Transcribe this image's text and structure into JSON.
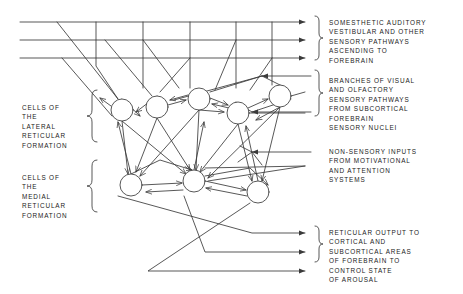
{
  "figure": {
    "stroke_color": "#3a3a3a",
    "text_color": "#1b1b1b",
    "background": "#ffffff"
  },
  "labels": {
    "somesthetic": "SOMESTHETIC AUDITORY\nVESTIBULAR AND OTHER\nSENSORY PATHWAYS\nASCENDING TO\nFOREBRAIN",
    "branches": "BRANCHES OF VISUAL\nAND OLFACTORY\nSENSORY PATHWAYS\nFROM SUBCORTICAL\nFOREBRAIN\nSENSORY NUCLEI",
    "nonsensory": "NON-SENSORY INPUTS\nFROM MOTIVATIONAL\nAND ATTENTION\nSYSTEMS",
    "reticular_output": "RETICULAR OUTPUT TO\nCORTICAL AND\nSUBCORTICAL AREAS\nOF FOREBRAIN TO\nCONTROL STATE\nOF AROUSAL",
    "cells_lateral": "CELLS OF\nTHE\nLATERAL\nRETICULAR\nFORMATION",
    "cells_medial": "CELLS OF\nTHE\nMEDIAL\nRETICULAR\nFORMATION"
  },
  "network": {
    "lateral_neurons": [
      {
        "cx": 122,
        "cy": 110,
        "r": 11
      },
      {
        "cx": 157,
        "cy": 107,
        "r": 11
      },
      {
        "cx": 199,
        "cy": 99,
        "r": 11
      },
      {
        "cx": 238,
        "cy": 113,
        "r": 11
      },
      {
        "cx": 280,
        "cy": 96,
        "r": 11
      }
    ],
    "medial_neurons": [
      {
        "cx": 131,
        "cy": 185,
        "r": 11
      },
      {
        "cx": 194,
        "cy": 181,
        "r": 11
      },
      {
        "cx": 258,
        "cy": 192,
        "r": 11
      }
    ],
    "ascending_pathways": [
      {
        "y": 22,
        "x1": 20,
        "x2": 311
      },
      {
        "y": 40,
        "x1": 20,
        "x2": 311
      },
      {
        "y": 58,
        "x1": 20,
        "x2": 311
      }
    ],
    "sensory_branch_inputs": [
      {
        "y": 76,
        "x1": 311,
        "x2": 248
      },
      {
        "y": 112,
        "x1": 311,
        "x2": 248
      }
    ],
    "nonsensory_inputs": [
      {
        "y": 152,
        "x1": 311,
        "x2": 245
      }
    ],
    "output_arrows": [
      {
        "y": 233,
        "x1": 252,
        "x2": 311
      },
      {
        "y": 252,
        "x1": 205,
        "x2": 311
      },
      {
        "y": 271,
        "x1": 148,
        "x2": 311
      }
    ]
  }
}
